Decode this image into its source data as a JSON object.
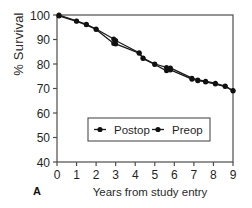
{
  "figure": {
    "panel_letter": "A",
    "xlabel": "Years from study entry",
    "ylabel": "% Survival"
  },
  "axis": {
    "y_ticks": [
      "100",
      "90",
      "80",
      "70",
      "60",
      "50",
      "40"
    ],
    "x_ticks": [
      "0",
      "1",
      "2",
      "3",
      "4",
      "5",
      "6",
      "7",
      "8",
      "9"
    ]
  },
  "legend": {
    "postop_label": "Postop",
    "preop_label": "Preop"
  },
  "colors": {
    "line": "#1a1a1a",
    "marker": "#111111",
    "frame": "#4d4d4d",
    "background": "#ffffff"
  },
  "chart_data": {
    "type": "line",
    "title": "",
    "xlabel": "Years from study entry",
    "ylabel": "% Survival",
    "xlim": [
      0,
      9
    ],
    "ylim": [
      40,
      100
    ],
    "xticks": [
      0,
      1,
      2,
      3,
      4,
      5,
      6,
      7,
      8,
      9
    ],
    "yticks": [
      40,
      50,
      60,
      70,
      80,
      90,
      100
    ],
    "grid": false,
    "legend_position": "lower-center",
    "series": [
      {
        "name": "Postop",
        "x": [
          0.1,
          1.0,
          1.5,
          2.0,
          2.9,
          3.0,
          4.2,
          4.4,
          5.0,
          5.6,
          5.8,
          6.9,
          7.2,
          7.6,
          8.1,
          8.6,
          9.0
        ],
        "y": [
          100.0,
          97.6,
          96.2,
          94.3,
          90.2,
          89.6,
          84.6,
          82.4,
          80.0,
          78.6,
          78.4,
          74.2,
          73.5,
          73.0,
          72.1,
          71.0,
          69.2
        ]
      },
      {
        "name": "Preop",
        "x": [
          0.1,
          1.0,
          1.5,
          2.0,
          2.9,
          3.0,
          4.2,
          4.4,
          5.0,
          5.6,
          5.8,
          6.9,
          7.2,
          7.6,
          8.1,
          8.6,
          9.0
        ],
        "y": [
          99.6,
          97.4,
          96.0,
          94.1,
          88.4,
          88.2,
          84.4,
          82.2,
          79.8,
          77.2,
          77.6,
          73.8,
          73.2,
          72.7,
          71.8,
          70.8,
          69.0
        ]
      }
    ]
  }
}
